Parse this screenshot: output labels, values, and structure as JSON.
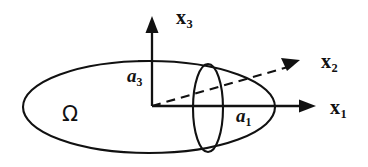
{
  "figure": {
    "kind": "3d-ellipsoid-axes-diagram",
    "background_color": "#ffffff",
    "ink_color": "#111111",
    "labels": {
      "axis_x1": "x",
      "axis_x1_sub": "1",
      "axis_x2": "x",
      "axis_x2_sub": "2",
      "axis_x3": "x",
      "axis_x3_sub": "3",
      "semiaxis_a1": "a",
      "semiaxis_a1_sub": "1",
      "semiaxis_a3": "a",
      "semiaxis_a3_sub": "3",
      "domain": "Ω"
    },
    "geometry": {
      "origin_x": 152,
      "origin_y": 106,
      "outer_ellipse": {
        "cx": 149,
        "cy": 107,
        "rx": 126,
        "ry": 46
      },
      "inner_ellipse": {
        "cx": 208,
        "cy": 108,
        "rx": 15,
        "ry": 44
      },
      "x1_axis_tip": {
        "x": 316,
        "y": 106
      },
      "x2_axis_tip": {
        "x": 300,
        "y": 60
      },
      "x3_axis_tip": {
        "x": 152,
        "y": 16
      },
      "x2_is_dashed": true
    }
  }
}
